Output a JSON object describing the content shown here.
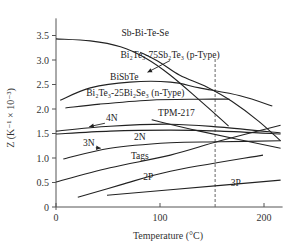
{
  "chart_data": {
    "type": "line",
    "title": "",
    "xlabel": "Temperature (°C)",
    "ylabel": "Z (K⁻¹ × 10⁻³)",
    "xlim": [
      0,
      215
    ],
    "ylim": [
      0,
      3.85
    ],
    "x_ticks": [
      {
        "value": 0,
        "label": "0"
      },
      {
        "value": 100,
        "label": "100"
      },
      {
        "value": 200,
        "label": "200"
      }
    ],
    "y_ticks": [
      {
        "value": 0,
        "label": "0"
      },
      {
        "value": 0.5,
        "label": "0.5"
      },
      {
        "value": 1.0,
        "label": "1.0"
      },
      {
        "value": 1.5,
        "label": "1.5"
      },
      {
        "value": 2.0,
        "label": "2.0"
      },
      {
        "value": 2.5,
        "label": "2.5"
      },
      {
        "value": 3.0,
        "label": "3.0"
      },
      {
        "value": 3.5,
        "label": "3.5"
      }
    ],
    "grid": false,
    "reference_line": {
      "x": 153,
      "style": "dashed"
    },
    "series": [
      {
        "name": "Sb-Bi-Te-Se",
        "x": [
          0,
          33,
          62,
          86,
          110,
          138,
          166
        ],
        "y": [
          3.43,
          3.39,
          3.27,
          3.04,
          2.69,
          2.18,
          1.65
        ]
      },
      {
        "name": "Bi2Te3-75Sb2Te3 (p-Type)",
        "x": [
          81,
          100,
          119,
          145,
          169,
          195,
          216
        ],
        "y": [
          3.16,
          2.95,
          2.69,
          2.45,
          2.16,
          1.75,
          1.35
        ]
      },
      {
        "name": "BiSbTe",
        "x": [
          4,
          33,
          71,
          110,
          138,
          177,
          208
        ],
        "y": [
          2.18,
          2.43,
          2.55,
          2.55,
          2.43,
          2.27,
          2.06
        ]
      },
      {
        "name": "Bi2Te3-25Bi2Se3 (n-Type)",
        "x": [
          9,
          42,
          90,
          138,
          167
        ],
        "y": [
          2.02,
          2.1,
          2.18,
          2.2,
          2.2
        ]
      },
      {
        "name": "4N",
        "x": [
          0,
          52,
          110,
          158,
          216
        ],
        "y": [
          1.55,
          1.65,
          1.69,
          1.63,
          1.51
        ]
      },
      {
        "name": "2N",
        "x": [
          0,
          52,
          110,
          158,
          216
        ],
        "y": [
          1.49,
          1.55,
          1.57,
          1.55,
          1.49
        ]
      },
      {
        "name": "3N",
        "x": [
          7,
          52,
          110,
          158,
          216
        ],
        "y": [
          0.98,
          1.2,
          1.31,
          1.33,
          1.35
        ]
      },
      {
        "name": "Tags",
        "x": [
          0,
          52,
          110,
          158,
          216
        ],
        "y": [
          0.51,
          0.8,
          1.06,
          1.35,
          1.67
        ]
      },
      {
        "name": "TPM-217",
        "x": [
          92,
          138,
          216
        ],
        "y": [
          1.78,
          1.55,
          1.2
        ]
      },
      {
        "name": "2P",
        "x": [
          21,
          62,
          110,
          199
        ],
        "y": [
          0.2,
          0.45,
          0.73,
          1.06
        ]
      },
      {
        "name": "3P",
        "x": [
          49,
          110,
          216
        ],
        "y": [
          0.24,
          0.35,
          0.55
        ]
      }
    ],
    "annotations": [
      {
        "text": "Sb-Bi-Te-Se",
        "x": 63,
        "y": 3.5
      },
      {
        "text": "Bi₂Te₃-75Sb₂Te₃ (p-Type)",
        "x": 62,
        "y": 3.05,
        "arrow_to": [
          88,
          2.75
        ]
      },
      {
        "text": "BiSbTe",
        "x": 52,
        "y": 2.6
      },
      {
        "text": "Bi₂Te₃-25Bi₂Se₃ (n-Type)",
        "x": 29,
        "y": 2.27
      },
      {
        "text": "4N",
        "x": 48,
        "y": 1.75,
        "arrow_to": [
          32,
          1.64
        ]
      },
      {
        "text": "TPM-217",
        "x": 98,
        "y": 1.85
      },
      {
        "text": "2N",
        "x": 75,
        "y": 1.37
      },
      {
        "text": "3N",
        "x": 26,
        "y": 1.25,
        "arrow_to": [
          43,
          1.2
        ]
      },
      {
        "text": "Tags",
        "x": 72,
        "y": 0.98
      },
      {
        "text": "2P",
        "x": 84,
        "y": 0.55
      },
      {
        "text": "3P",
        "x": 168,
        "y": 0.42
      }
    ]
  }
}
